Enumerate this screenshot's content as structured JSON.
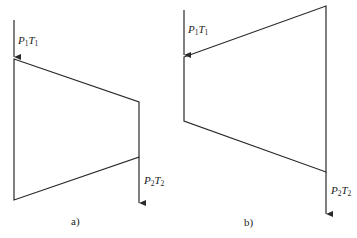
{
  "diagrams": [
    {
      "id": "a",
      "caption": "a)",
      "inlet_label": {
        "var1": "P",
        "sub1": "1",
        "var2": "T",
        "sub2": "1"
      },
      "outlet_label": {
        "var1": "P",
        "sub1": "2",
        "var2": "T",
        "sub2": "2"
      },
      "shape": "converging trapezoid (wide inlet, narrow outlet)"
    },
    {
      "id": "b",
      "caption": "b)",
      "inlet_label": {
        "var1": "P",
        "sub1": "1",
        "var2": "T",
        "sub2": "1"
      },
      "outlet_label": {
        "var1": "P",
        "sub1": "2",
        "var2": "T",
        "sub2": "2"
      },
      "shape": "diverging trapezoid (narrow inlet, wide outlet)"
    }
  ]
}
